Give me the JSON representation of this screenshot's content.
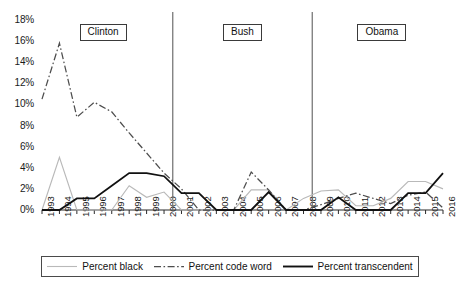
{
  "chart_data": {
    "type": "line",
    "title": "",
    "xlabel": "",
    "ylabel": "",
    "x": [
      1993,
      1994,
      1995,
      1996,
      1997,
      1998,
      1999,
      2000,
      2001,
      2002,
      2003,
      2004,
      2005,
      2006,
      2007,
      2008,
      2009,
      2010,
      2011,
      2012,
      2013,
      2014,
      2015,
      2016
    ],
    "categories": [
      "1993",
      "1994",
      "1995",
      "1996",
      "1997",
      "1998",
      "1999",
      "2000",
      "2001",
      "2002",
      "2003",
      "2004",
      "2005",
      "2006",
      "2007",
      "2008",
      "2009",
      "2010",
      "2011",
      "2012",
      "2013",
      "2014",
      "2015",
      "2016"
    ],
    "xlim": [
      1993,
      2016
    ],
    "ylim": [
      0,
      18
    ],
    "ytick_labels": [
      "0%",
      "2%",
      "4%",
      "6%",
      "8%",
      "10%",
      "12%",
      "14%",
      "16%",
      "18%"
    ],
    "ytick_values": [
      0,
      2,
      4,
      6,
      8,
      10,
      12,
      14,
      16,
      18
    ],
    "grid": false,
    "legend_position": "bottom",
    "series": [
      {
        "name": "Percent black",
        "style": "solid",
        "color": "#b9b9b9",
        "values": [
          0,
          5.0,
          0,
          0,
          0,
          2.3,
          1.2,
          1.7,
          0,
          0,
          0,
          0,
          1.9,
          1.9,
          0,
          1.1,
          1.8,
          1.9,
          0.4,
          0.4,
          1.1,
          2.7,
          2.7,
          2.0
        ]
      },
      {
        "name": "Percent code word",
        "style": "dash-dot",
        "color": "#4d4d4d",
        "values": [
          10.5,
          15.8,
          8.8,
          10.2,
          9.3,
          7.3,
          5.4,
          3.5,
          2.0,
          0,
          0,
          0,
          3.6,
          1.9,
          0,
          0,
          0.5,
          1.1,
          1.6,
          1.1,
          0.6,
          1.4,
          1.7,
          0.2
        ]
      },
      {
        "name": "Percent transcendent",
        "style": "solid",
        "color": "#111111",
        "values": [
          0,
          0,
          1.1,
          1.1,
          2.3,
          3.5,
          3.5,
          3.2,
          1.6,
          1.6,
          0,
          0,
          0,
          1.7,
          0,
          0,
          0,
          1.2,
          0,
          0,
          0,
          1.6,
          1.6,
          3.5
        ]
      }
    ],
    "annotations": [
      {
        "label": "Clinton",
        "start_year": 1993,
        "end_year": 2000
      },
      {
        "label": "Bush",
        "start_year": 2001,
        "end_year": 2008
      },
      {
        "label": "Obama",
        "start_year": 2009,
        "end_year": 2016
      }
    ],
    "dividers": [
      2000.5,
      2008.5
    ]
  },
  "legend": {
    "entries": [
      {
        "label": "Percent black",
        "swatch": "solid-light-line"
      },
      {
        "label": "Percent code word",
        "swatch": "dash-dot-line"
      },
      {
        "label": "Percent transcendent",
        "swatch": "solid-dark-line"
      }
    ]
  }
}
